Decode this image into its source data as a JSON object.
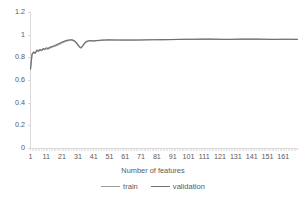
{
  "chart_data": {
    "type": "line",
    "title": "",
    "xlabel": "Number of features",
    "ylabel": "",
    "ylim": [
      0,
      1.2
    ],
    "xlim": [
      1,
      170
    ],
    "grid": false,
    "legend_position": "bottom",
    "y_ticks": [
      "0",
      "0.2",
      "0.4",
      "0.6",
      "0.8",
      "1",
      "1.2"
    ],
    "y_tick_values": [
      0,
      0.2,
      0.4,
      0.6,
      0.8,
      1,
      1.2
    ],
    "x_ticks": [
      "1",
      "11",
      "21",
      "31",
      "41",
      "51",
      "61",
      "71",
      "81",
      "91",
      "101",
      "111",
      "121",
      "131",
      "141",
      "151",
      "161"
    ],
    "x_tick_values": [
      1,
      11,
      21,
      31,
      41,
      51,
      61,
      71,
      81,
      91,
      101,
      111,
      121,
      131,
      141,
      151,
      161
    ],
    "series": [
      {
        "name": "train",
        "color": "#9c9c9c",
        "x": [
          1,
          2,
          3,
          4,
          5,
          6,
          7,
          8,
          9,
          10,
          11,
          12,
          13,
          14,
          15,
          16,
          17,
          18,
          19,
          20,
          21,
          22,
          23,
          24,
          25,
          26,
          27,
          28,
          29,
          30,
          31,
          32,
          33,
          34,
          35,
          36,
          37,
          38,
          39,
          40,
          41,
          42,
          43,
          44,
          45,
          46,
          47,
          48,
          49,
          50,
          55,
          60,
          65,
          70,
          75,
          80,
          85,
          90,
          95,
          100,
          105,
          110,
          115,
          120,
          125,
          130,
          135,
          140,
          145,
          150,
          155,
          160,
          165,
          170
        ],
        "values": [
          0.7,
          0.83,
          0.845,
          0.838,
          0.862,
          0.855,
          0.868,
          0.862,
          0.875,
          0.872,
          0.88,
          0.876,
          0.885,
          0.89,
          0.895,
          0.9,
          0.905,
          0.912,
          0.918,
          0.925,
          0.932,
          0.938,
          0.944,
          0.948,
          0.952,
          0.955,
          0.956,
          0.952,
          0.944,
          0.93,
          0.912,
          0.893,
          0.885,
          0.9,
          0.922,
          0.936,
          0.944,
          0.948,
          0.95,
          0.949,
          0.948,
          0.949,
          0.951,
          0.952,
          0.953,
          0.954,
          0.955,
          0.956,
          0.957,
          0.958,
          0.957,
          0.956,
          0.956,
          0.957,
          0.958,
          0.959,
          0.96,
          0.961,
          0.962,
          0.963,
          0.963,
          0.964,
          0.964,
          0.963,
          0.962,
          0.963,
          0.964,
          0.964,
          0.964,
          0.963,
          0.962,
          0.963,
          0.963,
          0.962
        ]
      },
      {
        "name": "validation",
        "color": "#6f6f6f",
        "x": [
          1,
          2,
          3,
          4,
          5,
          6,
          7,
          8,
          9,
          10,
          11,
          12,
          13,
          14,
          15,
          16,
          17,
          18,
          19,
          20,
          21,
          22,
          23,
          24,
          25,
          26,
          27,
          28,
          29,
          30,
          31,
          32,
          33,
          34,
          35,
          36,
          37,
          38,
          39,
          40,
          41,
          42,
          43,
          44,
          45,
          46,
          47,
          48,
          49,
          50,
          55,
          60,
          65,
          70,
          75,
          80,
          85,
          90,
          95,
          100,
          105,
          110,
          115,
          120,
          125,
          130,
          135,
          140,
          145,
          150,
          155,
          160,
          165,
          170
        ],
        "values": [
          0.7,
          0.835,
          0.852,
          0.842,
          0.87,
          0.861,
          0.874,
          0.866,
          0.882,
          0.877,
          0.888,
          0.882,
          0.892,
          0.897,
          0.902,
          0.907,
          0.913,
          0.92,
          0.926,
          0.932,
          0.94,
          0.945,
          0.95,
          0.954,
          0.957,
          0.959,
          0.96,
          0.956,
          0.948,
          0.934,
          0.916,
          0.897,
          0.89,
          0.906,
          0.928,
          0.941,
          0.948,
          0.951,
          0.952,
          0.951,
          0.95,
          0.951,
          0.953,
          0.954,
          0.955,
          0.956,
          0.957,
          0.958,
          0.958,
          0.959,
          0.958,
          0.957,
          0.957,
          0.958,
          0.959,
          0.96,
          0.961,
          0.962,
          0.963,
          0.964,
          0.964,
          0.965,
          0.965,
          0.964,
          0.963,
          0.964,
          0.965,
          0.965,
          0.965,
          0.964,
          0.963,
          0.964,
          0.964,
          0.963
        ]
      }
    ],
    "axis_color": "#d9d9d9",
    "text_color": "#595959"
  },
  "legend": {
    "entries": [
      {
        "label": "train"
      },
      {
        "label": "validation"
      }
    ]
  },
  "axis": {
    "x_title": "Number of features"
  }
}
